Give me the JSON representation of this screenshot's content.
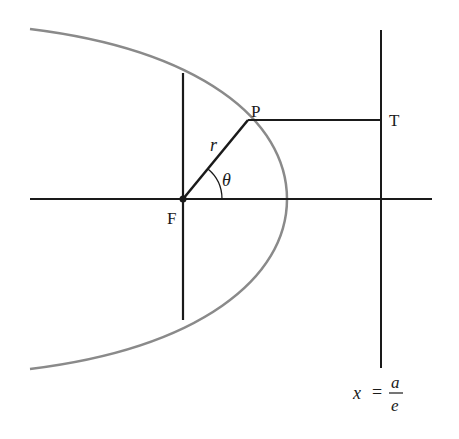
{
  "diagram": {
    "type": "focus-directrix conic (ellipse)",
    "labels": {
      "focus": "F",
      "point": "P",
      "directrix_point": "T",
      "radius": "r",
      "angle": "θ",
      "directrix_x": "x",
      "directrix_eq": "=",
      "directrix_num": "a",
      "directrix_den": "e"
    },
    "colors": {
      "lines": "#1a1a1a",
      "curve": "#8a8a8a",
      "background": "#ffffff"
    }
  }
}
